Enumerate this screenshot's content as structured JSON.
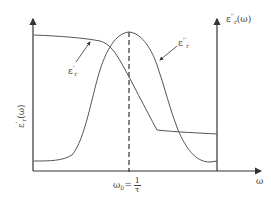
{
  "diagram": {
    "left_axis_label": {
      "symbol": "ε",
      "sub": "r",
      "sup": "'",
      "arg": "(ω)"
    },
    "right_axis_label": {
      "symbol": "ε",
      "sub": "r",
      "sup": "''",
      "arg": "(ω)"
    },
    "x_axis_label": "ω",
    "tick_label": {
      "lhs": "ω",
      "lhs_sub": "0",
      "eq": "=",
      "num": "1",
      "den": "τ"
    },
    "curve_real_label": {
      "symbol": "ε",
      "sub": "r",
      "sup": "'"
    },
    "curve_imag_label": {
      "symbol": "ε",
      "sub": "r",
      "sup": "''"
    },
    "colors": {
      "axis": "#333333",
      "curve": "#555555",
      "text": "#444444"
    }
  }
}
